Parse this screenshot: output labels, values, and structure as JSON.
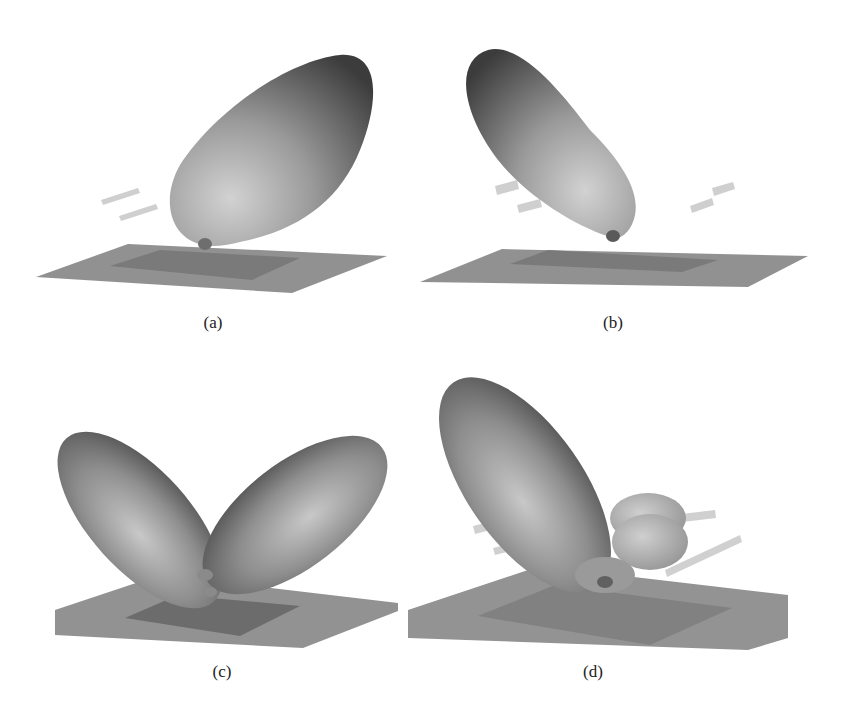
{
  "figure": {
    "colors": {
      "lobe_dark": "#4a4a4a",
      "lobe_mid": "#8c8c8c",
      "lobe_light": "#c4c4c4",
      "ground_plane": "#8f8f8f",
      "patch": "#6f6f6f",
      "strip": "#c8c8c8"
    },
    "panels": [
      {
        "id": "a",
        "caption": "(a)",
        "pattern": "single tilted main beam toward right"
      },
      {
        "id": "b",
        "caption": "(b)",
        "pattern": "single tilted main beam toward left"
      },
      {
        "id": "c",
        "caption": "(c)",
        "pattern": "two symmetric lobes (split beam)"
      },
      {
        "id": "d",
        "caption": "(d)",
        "pattern": "main beam toward left with smaller side lobes"
      }
    ]
  }
}
